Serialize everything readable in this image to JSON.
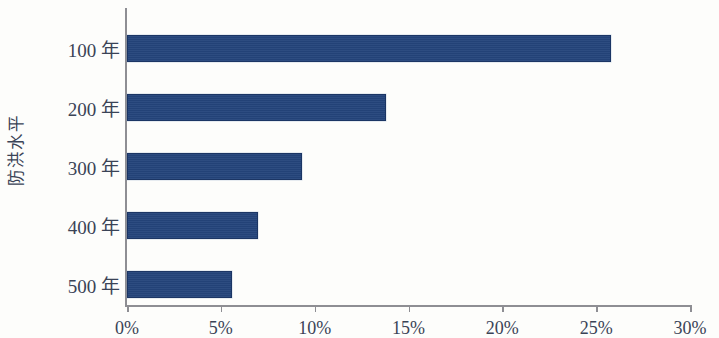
{
  "chart_data": {
    "type": "bar",
    "orientation": "horizontal",
    "title": "",
    "xlabel": "",
    "ylabel": "防洪水平",
    "categories": [
      "100 年",
      "200 年",
      "300 年",
      "400 年",
      "500 年"
    ],
    "values": [
      25.8,
      13.8,
      9.3,
      7.0,
      5.6
    ],
    "value_unit": "%",
    "xlim": [
      0,
      30
    ],
    "xticks": [
      0,
      5,
      10,
      15,
      20,
      25,
      30
    ],
    "xtick_labels": [
      "0%",
      "5%",
      "10%",
      "15%",
      "20%",
      "25%",
      "30%"
    ],
    "grid": false,
    "legend": false,
    "series": [
      {
        "name": "",
        "values": [
          25.8,
          13.8,
          9.3,
          7.0,
          5.6
        ]
      }
    ]
  },
  "style": {
    "bar_color": "#24447b",
    "bar_border_color": "#1b3564",
    "axis_color": "#8e8e93",
    "text_color": "#3a4356",
    "background": "#fdfdfb"
  }
}
